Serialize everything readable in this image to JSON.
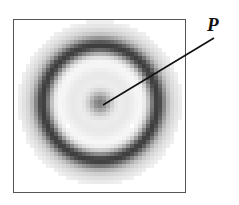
{
  "figure": {
    "label": "P",
    "ring": {
      "center": [
        100,
        103
      ],
      "outer_halo_radius": 82,
      "dark_ring_radius": 57,
      "dark_ring_width": 14,
      "center_spot_radius": 12,
      "pixel_size": 4
    },
    "pointer": {
      "from": [
        103,
        105
      ],
      "to": [
        214,
        38
      ]
    },
    "colors": {
      "frame": "#555555",
      "dark": "#3a3a3a",
      "background": "#ffffff"
    }
  }
}
